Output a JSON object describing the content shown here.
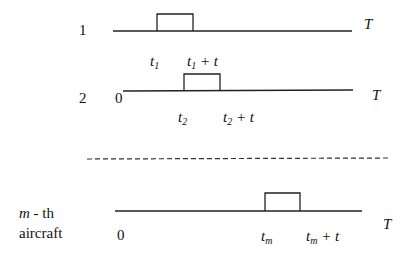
{
  "diagram": {
    "rows": [
      {
        "label": "1",
        "origin": "",
        "start": "t",
        "start_sub": "1",
        "end_prefix": "t",
        "end_sub": "1",
        "end_suffix": "+ t",
        "end_label": "T"
      },
      {
        "label": "2",
        "origin": "0",
        "start": "t",
        "start_sub": "2",
        "end_prefix": "t",
        "end_sub": "2",
        "end_suffix": "+ t",
        "end_label": "T"
      },
      {
        "label_var": "m",
        "label_rest": "- th",
        "label_line2": "aircraft",
        "origin": "0",
        "start": "t",
        "start_sub": "m",
        "end_prefix": "t",
        "end_sub": "m",
        "end_suffix": "+ t",
        "end_label": "T"
      }
    ],
    "separator": "dashed"
  }
}
